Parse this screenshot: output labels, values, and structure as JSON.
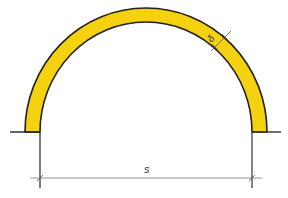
{
  "diagram": {
    "type": "arch-cross-section",
    "span_label": "s",
    "thickness_label": "δ",
    "colors": {
      "arch_fill": "#F5D20F",
      "outline": "#222222",
      "dimension_line": "#555555"
    }
  }
}
